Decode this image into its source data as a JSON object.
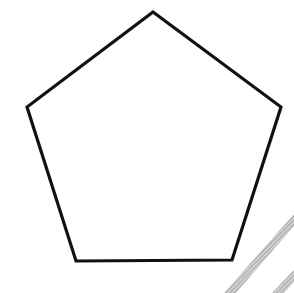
{
  "diagram": {
    "shape": "regular-pentagon",
    "background": "#ffffff",
    "stroke_color": "#111111",
    "stroke_width": 3.2,
    "fill": "none",
    "vertices": [
      [
        153,
        12
      ],
      [
        281,
        107
      ],
      [
        232,
        260
      ],
      [
        76,
        261
      ],
      [
        27,
        107
      ]
    ],
    "points_attr": "153,12 281,107 232,260 76,261 27,107",
    "hatch": {
      "color": "#b0b0b0",
      "stripes": [
        {
          "points": "294,214 294,226 236,293 224,293"
        },
        {
          "points": "294,270 294,282 284,293 272,293"
        }
      ]
    }
  }
}
